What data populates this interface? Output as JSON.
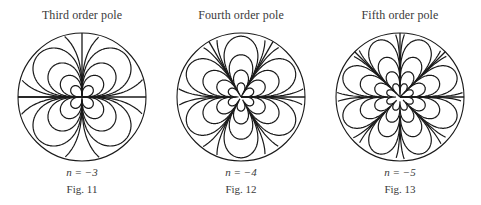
{
  "figures": [
    {
      "title": "Third order pole",
      "n_label": "n = −3",
      "fig_label": "Fig. 11",
      "order": 3,
      "center_x": 82,
      "rotation": 0
    },
    {
      "title": "Fourth order pole",
      "n_label": "n = −4",
      "fig_label": "Fig. 12",
      "order": 4,
      "center_x": 241,
      "rotation": 0
    },
    {
      "title": "Fifth order pole",
      "n_label": "n = −5",
      "fig_label": "Fig. 13",
      "order": 5,
      "center_x": 400,
      "rotation": 0
    }
  ],
  "style": {
    "line_color": "#1a1a1a",
    "circle_radius": 64
  }
}
